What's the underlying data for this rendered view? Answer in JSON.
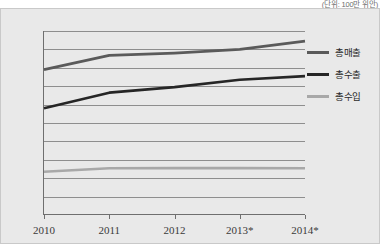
{
  "unit_note": "(단위: 100만 위안)",
  "colors": {
    "panel_background": "#e9e9e9",
    "panel_border": "#c9c9c9",
    "gridline": "#8e8e8e",
    "axis": "#6f6f6f",
    "text": "#3a3a3a",
    "series_total_sales": "#5a5a5a",
    "series_total_exports": "#262626",
    "series_total_imports": "#a8a8a8"
  },
  "legend": {
    "position": "right",
    "items": [
      {
        "label": "총매출",
        "color": "#5a5a5a"
      },
      {
        "label": "총수출",
        "color": "#262626"
      },
      {
        "label": "총수입",
        "color": "#a8a8a8"
      }
    ]
  },
  "chart_data": {
    "type": "line",
    "title": "",
    "subtitle": "",
    "annotation": "(단위: 100만 위안)",
    "xlabel": "",
    "ylabel": "",
    "categories": [
      "2010",
      "2011",
      "2012",
      "2013*",
      "2014*"
    ],
    "ylim": [
      0,
      2000
    ],
    "yticks": [
      0,
      200,
      400,
      600,
      800,
      1000,
      1200,
      1400,
      1600,
      1800,
      2000
    ],
    "ytick_labels": [
      "0",
      "200",
      "400",
      "600",
      "800",
      "1000",
      "1200",
      "1400",
      "1600",
      "1800",
      "2000"
    ],
    "grid": true,
    "grid_axis": "y",
    "legend_position": "right",
    "series": [
      {
        "name": "총매출",
        "color": "#5a5a5a",
        "values": [
          1580,
          1735,
          1760,
          1800,
          1890
        ]
      },
      {
        "name": "총수출",
        "color": "#262626",
        "values": [
          1160,
          1330,
          1390,
          1470,
          1510
        ]
      },
      {
        "name": "총수입",
        "color": "#a8a8a8",
        "values": [
          470,
          508,
          510,
          510,
          508
        ]
      }
    ]
  }
}
